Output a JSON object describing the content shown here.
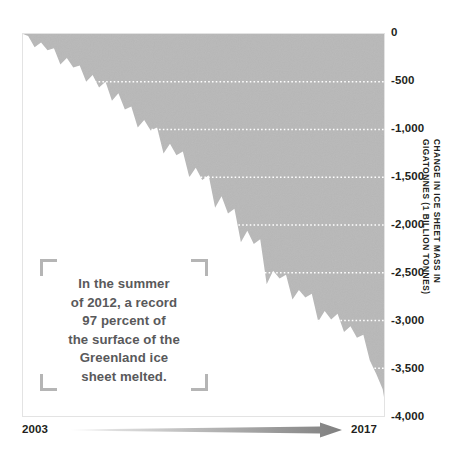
{
  "chart_data": {
    "type": "area",
    "title": "",
    "subtitle": "",
    "xlabel": "",
    "ylabel": "CHANGE IN ICE SHEET MASS IN\nGIGATONNES (1 BILLION TONNES)",
    "ylim": [
      -4000,
      0
    ],
    "xlim": [
      2003,
      2017
    ],
    "yticks": [
      0,
      -500,
      -1000,
      -1500,
      -2000,
      -2500,
      -3000,
      -3500,
      -4000
    ],
    "ytick_labels": [
      "0",
      "-500",
      "-1,000",
      "-1,500",
      "-2,000",
      "-2,500",
      "-3,000",
      "-3,500",
      "-4,000"
    ],
    "xtick_labels": [
      "2003",
      "2017"
    ],
    "grid": "horizontal-dotted-white",
    "legend": "none",
    "series_name": "Greenland ice sheet mass change",
    "fill_color": "#b8b8b8",
    "x": [
      2003.2,
      2003.45,
      2003.7,
      2003.95,
      2004.2,
      2004.45,
      2004.7,
      2004.95,
      2005.2,
      2005.45,
      2005.7,
      2005.95,
      2006.2,
      2006.45,
      2006.7,
      2006.95,
      2007.2,
      2007.45,
      2007.7,
      2007.95,
      2008.2,
      2008.45,
      2008.7,
      2008.95,
      2009.2,
      2009.45,
      2009.7,
      2009.95,
      2010.2,
      2010.45,
      2010.7,
      2010.95,
      2011.2,
      2011.45,
      2011.7,
      2011.95,
      2012.2,
      2012.45,
      2012.7,
      2012.95,
      2013.2,
      2013.45,
      2013.7,
      2013.95,
      2014.2,
      2014.45,
      2014.7,
      2014.95,
      2015.2,
      2015.45,
      2015.7,
      2015.95,
      2016.2,
      2016.45,
      2016.7,
      2016.95,
      2017.0
    ],
    "values": [
      -20,
      -140,
      -90,
      -170,
      -150,
      -320,
      -250,
      -350,
      -330,
      -500,
      -430,
      -560,
      -500,
      -700,
      -620,
      -790,
      -760,
      -980,
      -900,
      -1010,
      -980,
      -1250,
      -1150,
      -1270,
      -1230,
      -1500,
      -1400,
      -1530,
      -1480,
      -1820,
      -1700,
      -1880,
      -1830,
      -2180,
      -2060,
      -2200,
      -2150,
      -2620,
      -2480,
      -2560,
      -2520,
      -2780,
      -2680,
      -2760,
      -2720,
      -3010,
      -2900,
      -2990,
      -2930,
      -3120,
      -3060,
      -3180,
      -3150,
      -3420,
      -3560,
      -3720,
      -3800
    ],
    "annotation": "In the summer\nof 2012, a record\n97 percent of\nthe surface of the\nGreenland ice\nsheet melted.",
    "annotation_year": 2012,
    "axis_arrow": "left-to-right-gradient",
    "units": "gigatonnes"
  },
  "yaxis": {
    "title": "CHANGE IN ICE SHEET MASS IN\nGIGATONNES (1 BILLION TONNES)",
    "ticks": [
      {
        "label": "0",
        "value": 0
      },
      {
        "label": "-500",
        "value": -500
      },
      {
        "label": "-1,000",
        "value": -1000
      },
      {
        "label": "-1,500",
        "value": -1500
      },
      {
        "label": "-2,000",
        "value": -2000
      },
      {
        "label": "-2,500",
        "value": -2500
      },
      {
        "label": "-3,000",
        "value": -3000
      },
      {
        "label": "-3,500",
        "value": -3500
      },
      {
        "label": "-4,000",
        "value": -4000
      }
    ]
  },
  "xaxis": {
    "start_label": "2003",
    "end_label": "2017"
  },
  "annotation": {
    "text": "In the summer\nof 2012, a record\n97 percent of\nthe surface of the\nGreenland ice\nsheet melted."
  },
  "colors": {
    "area_fill": "#b8b8b8",
    "gridline": "#ffffff",
    "tick_text": "#231f20",
    "annotation_text": "#59595b",
    "bracket": "#b5b5b5",
    "arrow_dark": "#808080",
    "plot_border": "#e3e3e3"
  }
}
